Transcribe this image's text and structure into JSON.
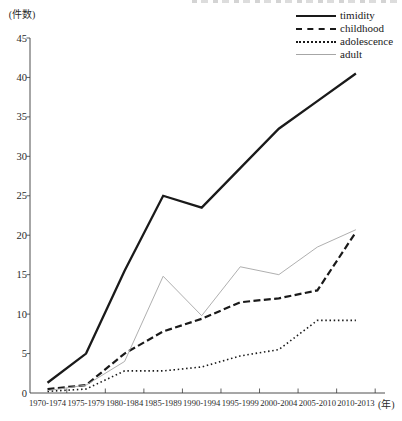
{
  "figure": {
    "y_axis_unit_label": "(件数)",
    "x_axis_unit_label": "(年)",
    "background_color": "#ffffff",
    "axis_color": "#3a3a3a",
    "top_caption_clipped": true
  },
  "legend": [
    {
      "label": "timidity",
      "style": "solid-thick",
      "color": "#1a1a1a"
    },
    {
      "label": "childhood",
      "style": "dashed",
      "color": "#1a1a1a"
    },
    {
      "label": "adolescence",
      "style": "dotted",
      "color": "#1a1a1a"
    },
    {
      "label": "adult",
      "style": "solid-thin",
      "color": "#a6a6a6"
    }
  ],
  "chart_data": {
    "type": "line",
    "title": "",
    "xlabel": "(年)",
    "ylabel": "(件数)",
    "ylim": [
      0,
      45
    ],
    "yticks": [
      0,
      5,
      10,
      15,
      20,
      25,
      30,
      35,
      40,
      45
    ],
    "grid": false,
    "legend_position": "top-right",
    "categories": [
      "1970-1974",
      "1975-1979",
      "1980-1984",
      "1985-1989",
      "1990-1994",
      "1995-1999",
      "2000-2004",
      "2005-2010",
      "2010-2013"
    ],
    "series": [
      {
        "name": "timidity",
        "values": [
          1.3,
          5,
          15.5,
          25,
          23.5,
          28.5,
          33.5,
          37,
          40.5
        ],
        "line": "solid",
        "width": 2.3,
        "color": "#1a1a1a"
      },
      {
        "name": "childhood",
        "values": [
          0.5,
          1,
          5,
          7.8,
          9.4,
          11.5,
          12,
          13,
          20.4
        ],
        "line": "dashed",
        "width": 2.2,
        "color": "#1a1a1a"
      },
      {
        "name": "adolescence",
        "values": [
          0.2,
          0.5,
          2.8,
          2.8,
          3.3,
          4.7,
          5.5,
          9.2,
          9.2
        ],
        "line": "dotted",
        "width": 1.6,
        "color": "#1a1a1a"
      },
      {
        "name": "adult",
        "values": [
          0.3,
          1,
          4,
          14.8,
          9.8,
          16,
          15,
          18.5,
          20.7
        ],
        "line": "thin",
        "width": 0.9,
        "color": "#a6a6a6"
      }
    ]
  }
}
